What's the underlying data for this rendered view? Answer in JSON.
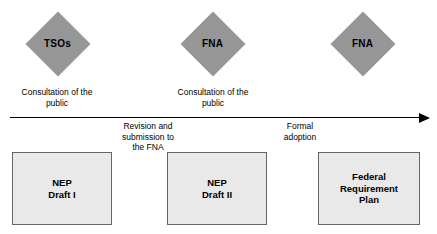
{
  "diagram": {
    "colors": {
      "diamond_fill": "#969696",
      "box_fill": "#e9e9e9",
      "box_border": "#666666",
      "arrow": "#000000",
      "background": "#ffffff"
    },
    "stages": [
      {
        "actor": "TSOs",
        "caption": "Consultation of the\npublic",
        "document": "NEP\nDraft I"
      },
      {
        "actor": "FNA",
        "caption": "Consultation of the\npublic",
        "document": "NEP\nDraft II"
      },
      {
        "actor": "FNA",
        "caption": "",
        "document": "Federal\nRequirement\nPlan"
      }
    ],
    "transitions": [
      {
        "label": "Revision and\nsubmission to\nthe FNA"
      },
      {
        "label": "Formal\nadoption"
      }
    ],
    "timeline": {
      "direction": "left-to-right",
      "arrowhead": "right"
    }
  }
}
